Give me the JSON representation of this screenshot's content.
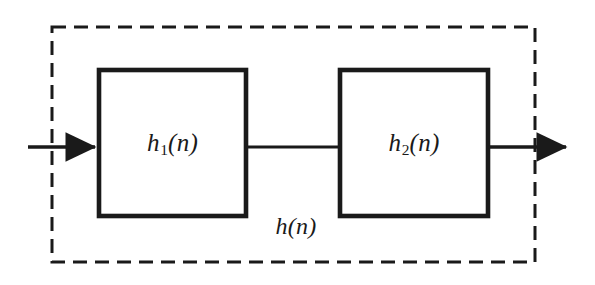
{
  "figure": {
    "type": "block-diagram",
    "background_color": "#ffffff",
    "stroke_color": "#1a1a1a",
    "text_color": "#1a1a1a"
  },
  "blocks": [
    {
      "id": "block-1",
      "label_base": "h",
      "label_subscript": "1",
      "label_arg": "(n)",
      "label_full": "h₁(n)",
      "x": 99,
      "y": 70,
      "width": 147,
      "height": 146
    },
    {
      "id": "block-2",
      "label_base": "h",
      "label_subscript": "2",
      "label_arg": "(n)",
      "label_full": "h₂(n)",
      "x": 340,
      "y": 70,
      "width": 148,
      "height": 146
    }
  ],
  "enclosure": {
    "id": "system-boundary",
    "style": "dashed",
    "label_base": "h",
    "label_arg": "(n)",
    "label_full": "h(n)",
    "x": 52,
    "y": 27,
    "width": 483,
    "height": 235,
    "dash": "14 8"
  },
  "connections": [
    {
      "id": "input-arrow",
      "kind": "arrow",
      "from_x": 28,
      "to_x": 99,
      "y": 147
    },
    {
      "id": "interconnect-line",
      "kind": "line",
      "from_x": 246,
      "to_x": 340,
      "y": 147
    },
    {
      "id": "output-arrow",
      "kind": "arrow",
      "from_x": 488,
      "to_x": 570,
      "y": 147
    }
  ]
}
